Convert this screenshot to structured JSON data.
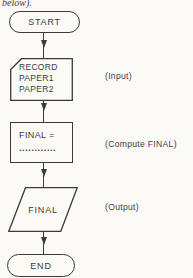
{
  "page": {
    "caption_fragment": "below).",
    "colors": {
      "paper": "#fbfaf7",
      "ink": "#3b3b3b"
    }
  },
  "flowchart": {
    "start": {
      "label": "START"
    },
    "input": {
      "line1": "RECORD",
      "line2": "PAPER1",
      "line3": "PAPER2",
      "annotation": "(Input)"
    },
    "compute": {
      "line1": "FINAL =",
      "line2": "............",
      "annotation": "(Compute FINAL)"
    },
    "output": {
      "label": "FINAL",
      "annotation": "(Output)"
    },
    "end": {
      "label": "END"
    }
  }
}
